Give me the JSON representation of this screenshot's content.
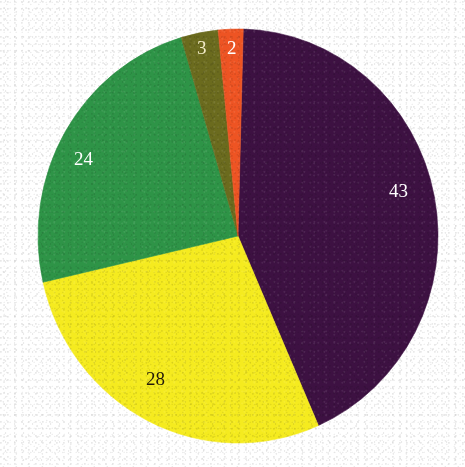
{
  "chart_data": {
    "type": "pie",
    "title": "",
    "subtitle": "",
    "xlabel": "",
    "ylabel": "",
    "legend": "none",
    "grid": false,
    "total": 100,
    "categories": [
      "43",
      "28",
      "24",
      "3",
      "2"
    ],
    "values": [
      43,
      28,
      24,
      3,
      2
    ],
    "slices": [
      {
        "label": "43",
        "value": 43,
        "color": "#3D1142",
        "label_color": "#FFFFFF",
        "start_angle_deg": 1.5,
        "end_angle_deg": 156.3,
        "label_x": 389,
        "label_y": 181,
        "label_size": 19
      },
      {
        "label": "28",
        "value": 28,
        "color": "#F5EB1F",
        "label_color": "#231A0B",
        "start_angle_deg": 156.3,
        "end_angle_deg": 257.1,
        "label_x": 146,
        "label_y": 369,
        "label_size": 19
      },
      {
        "label": "24",
        "value": 24,
        "color": "#2E9447",
        "label_color": "#FFFFFF",
        "start_angle_deg": 257.1,
        "end_angle_deg": 343.5,
        "label_x": 74,
        "label_y": 149,
        "label_size": 19
      },
      {
        "label": "3",
        "value": 3,
        "color": "#6B6B1E",
        "label_color": "#F2EBC8",
        "start_angle_deg": 343.5,
        "end_angle_deg": 354.3,
        "label_x": 197,
        "label_y": 38,
        "label_size": 19
      },
      {
        "label": "2",
        "value": 2,
        "color": "#EE5423",
        "label_color": "#FFFFFF",
        "start_angle_deg": 354.3,
        "end_angle_deg": 361.5,
        "label_x": 227,
        "label_y": 38,
        "label_size": 19
      }
    ],
    "geometry": {
      "center_x": 238,
      "center_y": 236,
      "radius_x": 200,
      "radius_y": 207
    },
    "colors": {
      "background": "#FFFFFF",
      "purple": "#3D1142",
      "yellow": "#F5EB1F",
      "green": "#2E9447",
      "olive": "#6B6B1E",
      "orange": "#EE5423"
    }
  }
}
